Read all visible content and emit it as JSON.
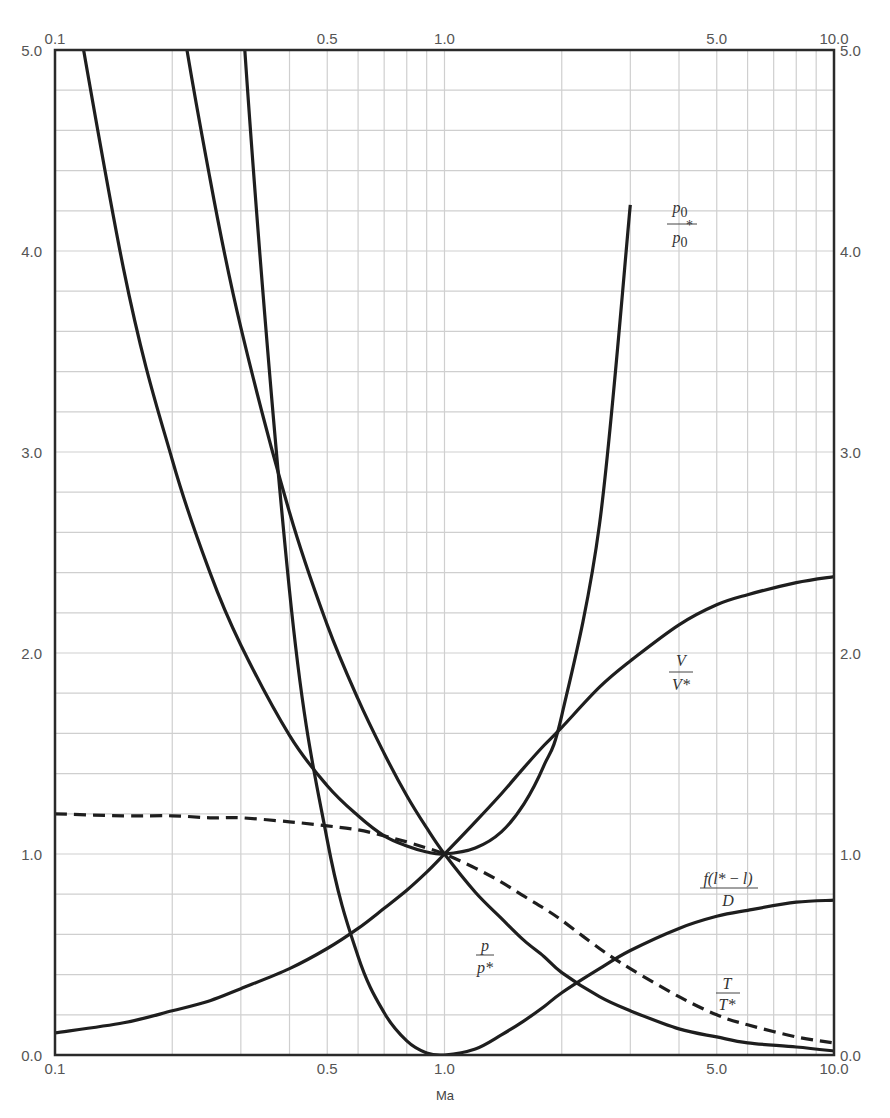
{
  "chart_data": {
    "type": "line",
    "title": "",
    "xlabel": "Ma",
    "ylabel": "",
    "x_scale": "log",
    "xlim": [
      0.1,
      10.0
    ],
    "ylim": [
      0.0,
      5.0
    ],
    "grid": true,
    "legend": "inline curve labels",
    "x_tick_labels_bottom": [
      "0.1",
      "0.5",
      "1.0",
      "5.0",
      "10.0"
    ],
    "x_tick_labels_top": [
      "0.1",
      "0.5",
      "1.0",
      "5.0",
      "10.0"
    ],
    "x_tick_values": [
      0.1,
      0.5,
      1.0,
      5.0,
      10.0
    ],
    "y_tick_labels_left": [
      "0.0",
      "1.0",
      "2.0",
      "3.0",
      "4.0",
      "5.0"
    ],
    "y_tick_labels_right": [
      "0.0",
      "1.0",
      "2.0",
      "3.0",
      "4.0",
      "5.0"
    ],
    "y_tick_values": [
      0,
      1,
      2,
      3,
      4,
      5
    ],
    "x": [
      0.1,
      0.15,
      0.2,
      0.25,
      0.3,
      0.4,
      0.5,
      0.6,
      0.7,
      0.8,
      0.9,
      1.0,
      1.2,
      1.4,
      1.6,
      1.8,
      2.0,
      2.5,
      3.0,
      4.0,
      5.0,
      6.0,
      8.0,
      10.0
    ],
    "series": [
      {
        "name": "p0/p0*",
        "label": "p0/p0*",
        "style": "solid",
        "values": [
          5.82,
          3.91,
          2.96,
          2.4,
          2.04,
          1.59,
          1.34,
          1.19,
          1.09,
          1.04,
          1.01,
          1.0,
          1.03,
          1.11,
          1.25,
          1.44,
          1.69,
          2.64,
          4.23,
          null,
          null,
          null,
          null,
          null
        ]
      },
      {
        "name": "p/p*",
        "label": "p/p*",
        "style": "solid",
        "values": [
          10.94,
          7.29,
          5.46,
          4.36,
          3.62,
          2.7,
          2.14,
          1.77,
          1.5,
          1.29,
          1.13,
          1.0,
          0.81,
          0.68,
          0.57,
          0.49,
          0.41,
          0.29,
          0.22,
          0.13,
          0.09,
          0.06,
          0.04,
          0.02
        ]
      },
      {
        "name": "f(l*-l)/D",
        "label": "f(l*-l)/D",
        "style": "solid",
        "values": [
          66.92,
          27.93,
          14.53,
          8.48,
          5.3,
          2.31,
          1.07,
          0.49,
          0.21,
          0.07,
          0.01,
          0.0,
          0.03,
          0.1,
          0.17,
          0.24,
          0.31,
          0.43,
          0.52,
          0.63,
          0.69,
          0.72,
          0.76,
          0.77
        ]
      },
      {
        "name": "V/V*",
        "label": "V/V*",
        "style": "solid",
        "values": [
          0.11,
          0.16,
          0.22,
          0.27,
          0.33,
          0.43,
          0.53,
          0.63,
          0.73,
          0.82,
          0.91,
          1.0,
          1.16,
          1.3,
          1.43,
          1.54,
          1.63,
          1.83,
          1.96,
          2.14,
          2.24,
          2.29,
          2.35,
          2.38
        ]
      },
      {
        "name": "T/T*",
        "label": "T/T*",
        "style": "dashed",
        "values": [
          1.2,
          1.19,
          1.19,
          1.18,
          1.18,
          1.16,
          1.14,
          1.12,
          1.09,
          1.06,
          1.03,
          1.0,
          0.93,
          0.86,
          0.79,
          0.73,
          0.67,
          0.53,
          0.43,
          0.29,
          0.2,
          0.15,
          0.09,
          0.06
        ]
      }
    ],
    "annotations": [
      {
        "text": "p0 / p0*",
        "x": 4.3,
        "y": 4.15
      },
      {
        "text": "V / V*",
        "x": 4.9,
        "y": 2.05
      },
      {
        "text": "f(l* - l) / D",
        "x": 7.0,
        "y": 0.87
      },
      {
        "text": "p / p*",
        "x": 1.45,
        "y": 0.53
      },
      {
        "text": "T / T*",
        "x": 7.2,
        "y": 0.4
      }
    ]
  },
  "labels": {
    "xlabel": "Ma",
    "p0_num": "p",
    "p0_num_sub": "0",
    "p0_den": "p",
    "p0_den_sub": "0",
    "p0_den_sup": "*",
    "v_num": "V",
    "v_den": "V*",
    "f_num": "f(l* − l)",
    "f_den": "D",
    "p_num": "p",
    "p_den": "p*",
    "t_num": "T",
    "t_den": "T*"
  }
}
